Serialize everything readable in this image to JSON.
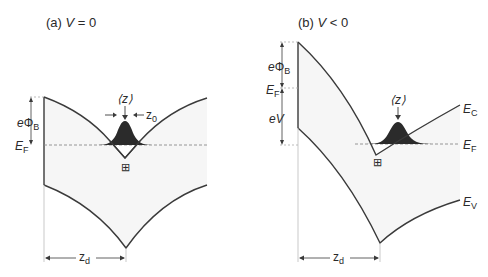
{
  "figure": {
    "panels": [
      {
        "id": "a",
        "title_prefix": "(a) ",
        "title_var": "V",
        "title_rel": " = 0",
        "labels": {
          "barrier_e": "e",
          "barrier_phi": "Φ",
          "barrier_sub": "B",
          "fermi_E": "E",
          "fermi_sub": "F",
          "mean_z": "⟨z⟩",
          "width_z": "z",
          "width_sub": "0",
          "depletion_z": "z",
          "depletion_sub": "d",
          "hole_symbol": "⊞"
        }
      },
      {
        "id": "b",
        "title_prefix": "(b) ",
        "title_var": "V",
        "title_rel": " < 0",
        "labels": {
          "barrier_e": "e",
          "barrier_phi": "Φ",
          "barrier_sub": "B",
          "fermi_E": "E",
          "fermi_sub": "F",
          "bias_e": "e",
          "bias_V": "V",
          "mean_z": "⟨z⟩",
          "conduction_E": "E",
          "conduction_sub": "C",
          "fermi_right_E": "E",
          "fermi_right_sub": "F",
          "valence_E": "E",
          "valence_sub": "V",
          "depletion_z": "z",
          "depletion_sub": "d",
          "hole_symbol": "⊞"
        }
      }
    ],
    "colors": {
      "line": "#3a3a3a",
      "dashed": "#8a8a8a",
      "gaussian_fill": "#2b2b2b",
      "region_fill": "#f6f6f6",
      "text": "#2a2a2a"
    }
  }
}
